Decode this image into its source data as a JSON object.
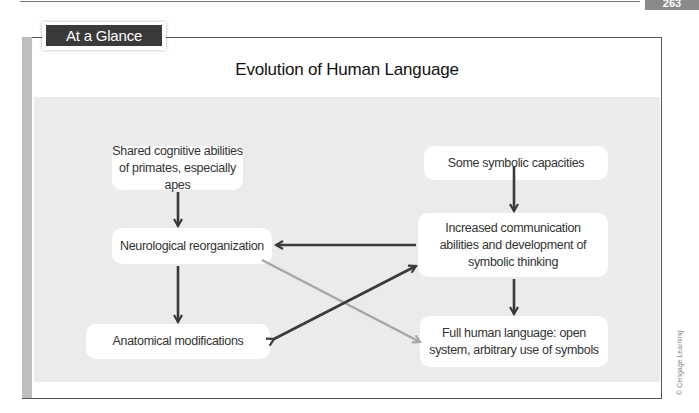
{
  "page": {
    "number": "263"
  },
  "badge": {
    "label": "At a Glance"
  },
  "diagram": {
    "title": "Evolution of Human Language",
    "nodes": {
      "primates": "Shared cognitive abilities of primates, especially apes",
      "neuro": "Neurological reorganization",
      "anatomical": "Anatomical modifications",
      "symbolic": "Some symbolic capacities",
      "communication": "Increased communication abilities and development of symbolic thinking",
      "language": "Full human language: open system, arbitrary use of symbols"
    },
    "edges": [
      {
        "from": "primates",
        "to": "neuro",
        "color": "#3a3a3a"
      },
      {
        "from": "neuro",
        "to": "anatomical",
        "color": "#3a3a3a"
      },
      {
        "from": "symbolic",
        "to": "communication",
        "color": "#3a3a3a"
      },
      {
        "from": "communication",
        "to": "neuro",
        "color": "#3a3a3a"
      },
      {
        "from": "communication",
        "to": "language",
        "color": "#3a3a3a"
      },
      {
        "from": "anatomical",
        "to": "communication",
        "color": "#3a3a3a",
        "bidirectional": true
      },
      {
        "from": "neuro",
        "to": "language",
        "color": "#a6a6a6"
      }
    ]
  },
  "credit": "© Cengage Learning",
  "colors": {
    "panel": "#ebebeb",
    "badge": "#3a3a3a",
    "arrow_dark": "#3a3a3a",
    "arrow_light": "#a6a6a6",
    "sidebar": "#bdbdbd"
  }
}
